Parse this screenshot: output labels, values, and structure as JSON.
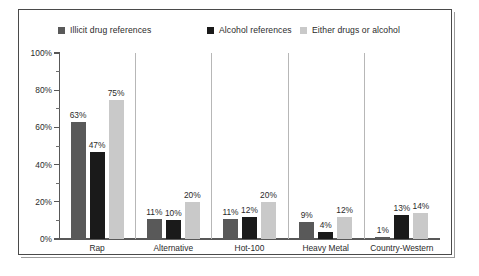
{
  "chart_data": {
    "type": "bar",
    "title": "",
    "subtitle": "",
    "xlabel": "",
    "ylabel": "",
    "ylim": [
      0,
      100
    ],
    "y_unit": "%",
    "grid": false,
    "legend_position": "top",
    "y_ticks": [
      "0%",
      "20%",
      "40%",
      "60%",
      "80%",
      "100%"
    ],
    "y_tick_values": [
      0,
      20,
      40,
      60,
      80,
      100
    ],
    "y_minor_tick_values": [
      10,
      30,
      50,
      70,
      90
    ],
    "categories": [
      "Rap",
      "Alternative",
      "Hot-100",
      "Heavy Metal",
      "Country-Western"
    ],
    "series": [
      {
        "name": "Illicit drug references",
        "color": "#595959",
        "values": [
          63,
          11,
          11,
          9,
          1
        ],
        "labels": [
          "63%",
          "11%",
          "11%",
          "9%",
          "1%"
        ]
      },
      {
        "name": "Alcohol references",
        "color": "#1a1a1a",
        "values": [
          47,
          10,
          12,
          4,
          13
        ],
        "labels": [
          "47%",
          "10%",
          "12%",
          "4%",
          "13%"
        ]
      },
      {
        "name": "Either drugs or alcohol",
        "color": "#c9c9c9",
        "values": [
          75,
          20,
          20,
          12,
          14
        ],
        "labels": [
          "75%",
          "20%",
          "20%",
          "12%",
          "14%"
        ]
      }
    ]
  },
  "colors": {
    "frame": "#4a4a4a",
    "axis": "#585858",
    "separator": "#b7b7b7",
    "text": "#2b2b2b",
    "background": "#ffffff"
  }
}
